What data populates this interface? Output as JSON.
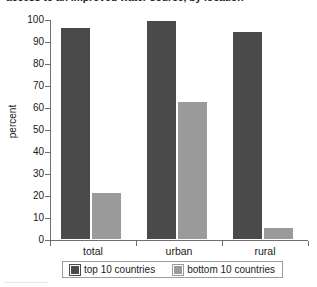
{
  "chart_data": {
    "type": "bar",
    "title": "access to an improved water source, by location",
    "title_truncated": true,
    "xlabel": "",
    "ylabel": "percent",
    "categories": [
      "total",
      "urban",
      "rural"
    ],
    "series": [
      {
        "name": "top 10 countries",
        "values": [
          97,
          100,
          95
        ],
        "color": "#4a4a4a"
      },
      {
        "name": "bottom 10 countries",
        "values": [
          22,
          63,
          6
        ],
        "color": "#9a9a9a"
      }
    ],
    "ylim": [
      0,
      100
    ],
    "yticks": [
      0,
      10,
      20,
      30,
      40,
      50,
      60,
      70,
      80,
      90,
      100
    ],
    "ytick_labels": [
      "0",
      "10",
      "20",
      "30",
      "40",
      "50",
      "60",
      "70",
      "80",
      "90",
      "100"
    ],
    "grid": false,
    "legend_position": "bottom"
  },
  "legend": {
    "entries": [
      {
        "label": "top 10 countries",
        "swatch": "top10"
      },
      {
        "label": "bottom 10 countries",
        "swatch": "bottom10"
      }
    ]
  },
  "colors": {
    "top10": "#4a4a4a",
    "bottom10": "#9a9a9a",
    "axis": "#6e6e6e",
    "text": "#1a1a1a",
    "background": "#ffffff"
  }
}
